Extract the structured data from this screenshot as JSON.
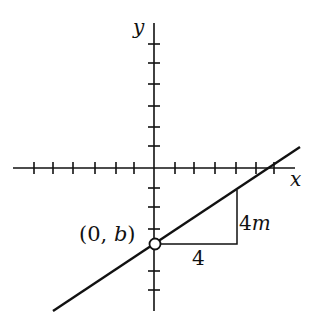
{
  "diagram": {
    "axes": {
      "x_label": "x",
      "y_label": "y",
      "x_ticks_left": [
        34,
        53,
        73,
        95,
        116,
        134
      ],
      "x_ticks_right": [
        175,
        194,
        215,
        236,
        256,
        274
      ],
      "y_ticks_up": [
        44,
        63,
        84,
        106,
        127,
        146
      ],
      "y_ticks_down": [
        188,
        207,
        229,
        271,
        290
      ]
    },
    "line": {
      "x1": 53,
      "y1": 311,
      "x2": 300,
      "y2": 147
    },
    "intercept_point": {
      "label_open": "(0, ",
      "label_var": "b",
      "label_close": ")"
    },
    "triangle": {
      "run_label": "4",
      "rise_label_num": "4",
      "rise_label_var": "m"
    },
    "colors": {
      "ink": "#111111",
      "background": "#ffffff"
    }
  }
}
